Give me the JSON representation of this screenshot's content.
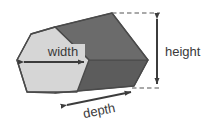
{
  "figure": {
    "labels": {
      "width": "width",
      "height": "height",
      "depth": "depth"
    },
    "colors": {
      "front_face": "#d4d4d4",
      "top_face": "#6e6e6e",
      "side_face": "#5f5f5f",
      "outline": "#4a4a4a",
      "arrow": "#3c3c3c",
      "dashed": "#555555",
      "text": "#3a3a3a",
      "background": "#ffffff"
    },
    "solid": {
      "shape": "hexagonal-prism",
      "faces": [
        {
          "name": "front-hexagon-face",
          "shade": "light"
        },
        {
          "name": "top-slanted-face",
          "shade": "dark"
        },
        {
          "name": "lower-right-face",
          "shade": "dark"
        }
      ]
    },
    "dimension_arrows": [
      {
        "name": "width-arrow",
        "orientation": "horizontal",
        "heads": "both"
      },
      {
        "name": "height-arrow",
        "orientation": "vertical",
        "heads": "both"
      },
      {
        "name": "depth-arrow",
        "orientation": "diagonal",
        "heads": "both"
      }
    ],
    "guide_lines": [
      {
        "name": "top-dashed-guide",
        "style": "dashed"
      },
      {
        "name": "bottom-dashed-guide",
        "style": "dashed"
      }
    ]
  }
}
